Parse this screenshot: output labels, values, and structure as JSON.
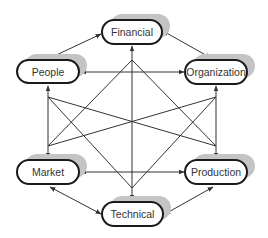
{
  "diagram": {
    "type": "relationship-network",
    "colors": {
      "node_border": "#1a1a1a",
      "shadow": "#c4c4c4",
      "edge": "#333333",
      "text": "#333333",
      "background": "#ffffff"
    },
    "nodes": [
      {
        "id": "financial",
        "label": "Financial",
        "x": 102,
        "y": 20,
        "w": 60,
        "h": 24
      },
      {
        "id": "people",
        "label": "People",
        "x": 17,
        "y": 60,
        "w": 62,
        "h": 23
      },
      {
        "id": "organization",
        "label": "Organization",
        "x": 185,
        "y": 60,
        "w": 62,
        "h": 24
      },
      {
        "id": "market",
        "label": "Market",
        "x": 17,
        "y": 160,
        "w": 62,
        "h": 24
      },
      {
        "id": "production",
        "label": "Production",
        "x": 185,
        "y": 160,
        "w": 62,
        "h": 24
      },
      {
        "id": "technical",
        "label": "Technical",
        "x": 102,
        "y": 202,
        "w": 61,
        "h": 24
      }
    ],
    "edges": [
      {
        "from": "financial",
        "to": "people",
        "directed": "both"
      },
      {
        "from": "financial",
        "to": "organization",
        "directed": "both"
      },
      {
        "from": "people",
        "to": "organization",
        "directed": "both"
      },
      {
        "from": "people",
        "to": "market",
        "directed": "both"
      },
      {
        "from": "organization",
        "to": "production",
        "directed": "both"
      },
      {
        "from": "market",
        "to": "production",
        "directed": "both"
      },
      {
        "from": "market",
        "to": "technical",
        "directed": "both"
      },
      {
        "from": "production",
        "to": "technical",
        "directed": "both"
      },
      {
        "from": "financial",
        "to": "technical",
        "directed": "both"
      },
      {
        "from": "financial",
        "to": "market",
        "directed": "both"
      },
      {
        "from": "financial",
        "to": "production",
        "directed": "both"
      },
      {
        "from": "technical",
        "to": "people",
        "directed": "both"
      },
      {
        "from": "technical",
        "to": "organization",
        "directed": "both"
      },
      {
        "from": "people",
        "to": "production",
        "directed": "both"
      },
      {
        "from": "organization",
        "to": "market",
        "directed": "both"
      }
    ]
  }
}
